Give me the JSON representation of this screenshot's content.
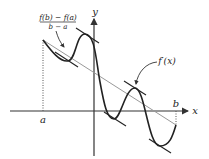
{
  "diagram": {
    "axes": {
      "x_label": "x",
      "y_label": "y",
      "point_a_label": "a",
      "point_b_label": "b"
    },
    "annotations": {
      "secant_numerator": "f(b) − f(a)",
      "secant_denominator": "b − a",
      "tangent_label": "f′(x)"
    },
    "colors": {
      "curve": "#222222",
      "axes": "#333333",
      "secant": "#999999",
      "tangent": "#222222",
      "dotted": "#555555"
    }
  }
}
